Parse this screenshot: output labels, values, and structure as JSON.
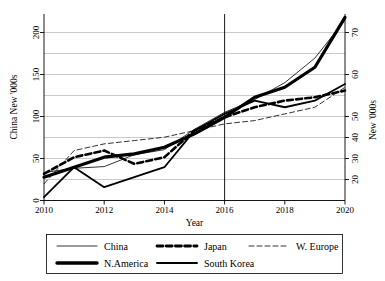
{
  "chart_data": {
    "type": "line",
    "title": "",
    "xlabel": "Year",
    "ylabel_left": "China New '000s",
    "ylabel_right": "New '000s",
    "x": [
      2010,
      2011,
      2012,
      2013,
      2014,
      2015,
      2016,
      2017,
      2018,
      2019,
      2020
    ],
    "xlim": [
      2010,
      2020
    ],
    "xticks": [
      2010,
      2012,
      2014,
      2016,
      2018,
      2020
    ],
    "xtick_labels": [
      "2010",
      "2012",
      "2014",
      "2016",
      "2018",
      "2020"
    ],
    "ylim_left": [
      -8,
      212
    ],
    "yticks_left": [
      0,
      50,
      100,
      150,
      200
    ],
    "ytick_labels_left": [
      "0",
      "50",
      "100",
      "150",
      "200"
    ],
    "ylim_right": [
      15.0,
      71.0
    ],
    "yticks_right": [
      20,
      30,
      40,
      50,
      60,
      70
    ],
    "ytick_labels_right": [
      "20",
      "30",
      "40",
      "50",
      "60",
      "70"
    ],
    "grid": true,
    "grid_axis": "y",
    "legend_position": "below",
    "annotations": [
      {
        "type": "vertical-line",
        "x": 2016,
        "label": "2016"
      }
    ],
    "series": [
      {
        "name": "China",
        "axis": "left",
        "style": "solid",
        "width": 0.8,
        "values": [
          25,
          30,
          32,
          46,
          52,
          76,
          96,
          111,
          131,
          160,
          205
        ]
      },
      {
        "name": "Japan",
        "axis": "right",
        "style": "dashed",
        "width": 2.6,
        "values": [
          23,
          28,
          30,
          26,
          28,
          36,
          40,
          43,
          45,
          46,
          48
        ]
      },
      {
        "name": "W. Europe",
        "axis": "right",
        "style": "dashed",
        "width": 0.8,
        "values": [
          20,
          30,
          32,
          33,
          34,
          36,
          38,
          39,
          41,
          43,
          49
        ]
      },
      {
        "name": "N.America",
        "axis": "right",
        "style": "solid",
        "width": 3.2,
        "values": [
          22,
          25,
          28,
          29,
          31,
          35,
          40,
          46,
          49,
          55,
          70
        ]
      },
      {
        "name": "South Korea",
        "axis": "right",
        "style": "solid",
        "width": 1.8,
        "values": [
          16,
          25,
          19,
          22,
          25,
          36,
          41,
          45,
          43,
          45,
          50
        ]
      }
    ]
  },
  "legend": {
    "entries": [
      {
        "label": "China",
        "key": "china-swatch"
      },
      {
        "label": "Japan",
        "key": "japan-swatch"
      },
      {
        "label": "W. Europe",
        "key": "weurope-swatch"
      },
      {
        "label": "N.America",
        "key": "namerica-swatch"
      },
      {
        "label": "South Korea",
        "key": "southkorea-swatch"
      }
    ]
  }
}
